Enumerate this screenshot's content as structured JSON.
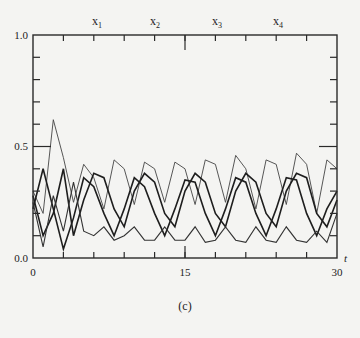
{
  "chart_data": {
    "type": "line",
    "title": "",
    "caption": "(c)",
    "xlabel": "t",
    "ylabel": "",
    "xlim": [
      0,
      30
    ],
    "ylim": [
      0.0,
      1.0
    ],
    "x_tick_labels": [
      "0",
      "15",
      "30"
    ],
    "y_tick_labels": [
      "0.0",
      "0.5",
      "1.0"
    ],
    "grid": false,
    "legend_position": "top (labels above top axis)",
    "legend": [
      "x1",
      "x2",
      "x3",
      "x4"
    ],
    "x": [
      0,
      1,
      2,
      3,
      4,
      5,
      6,
      7,
      8,
      9,
      10,
      11,
      12,
      13,
      14,
      15,
      16,
      17,
      18,
      19,
      20,
      21,
      22,
      23,
      24,
      25,
      26,
      27,
      28,
      29,
      30
    ],
    "series": [
      {
        "name": "x1",
        "values": [
          0.3,
          0.2,
          0.62,
          0.45,
          0.25,
          0.42,
          0.36,
          0.22,
          0.44,
          0.4,
          0.24,
          0.43,
          0.4,
          0.25,
          0.43,
          0.4,
          0.24,
          0.44,
          0.42,
          0.25,
          0.46,
          0.4,
          0.22,
          0.44,
          0.42,
          0.24,
          0.47,
          0.42,
          0.2,
          0.44,
          0.4
        ]
      },
      {
        "name": "x2",
        "values": [
          0.22,
          0.4,
          0.22,
          0.04,
          0.18,
          0.36,
          0.32,
          0.2,
          0.1,
          0.22,
          0.36,
          0.32,
          0.2,
          0.1,
          0.22,
          0.35,
          0.34,
          0.2,
          0.1,
          0.22,
          0.36,
          0.34,
          0.2,
          0.1,
          0.22,
          0.36,
          0.35,
          0.2,
          0.1,
          0.22,
          0.3
        ]
      },
      {
        "name": "x3",
        "values": [
          0.28,
          0.1,
          0.2,
          0.4,
          0.1,
          0.26,
          0.38,
          0.36,
          0.22,
          0.14,
          0.3,
          0.38,
          0.34,
          0.2,
          0.14,
          0.3,
          0.38,
          0.34,
          0.2,
          0.14,
          0.3,
          0.38,
          0.34,
          0.2,
          0.14,
          0.3,
          0.38,
          0.36,
          0.2,
          0.14,
          0.26
        ]
      },
      {
        "name": "x4",
        "values": [
          0.25,
          0.05,
          0.28,
          0.12,
          0.34,
          0.12,
          0.1,
          0.14,
          0.08,
          0.1,
          0.14,
          0.08,
          0.08,
          0.14,
          0.08,
          0.08,
          0.14,
          0.07,
          0.08,
          0.14,
          0.08,
          0.07,
          0.14,
          0.08,
          0.07,
          0.14,
          0.08,
          0.07,
          0.12,
          0.07,
          0.2
        ]
      }
    ]
  }
}
